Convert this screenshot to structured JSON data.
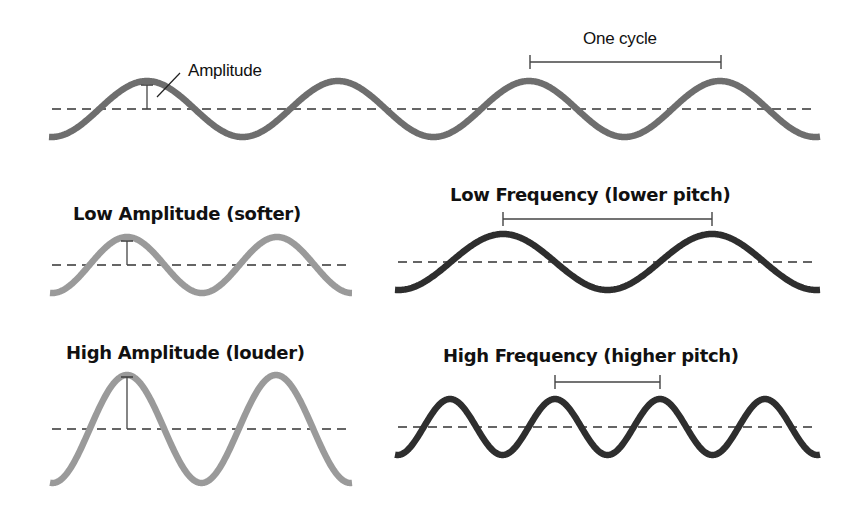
{
  "colors": {
    "wave_medium": "#6e6e6e",
    "wave_light": "#9a9a9a",
    "wave_dark": "#2e2e2e",
    "midline": "#333333",
    "marker": "#444444",
    "text": "#111111"
  },
  "labels": {
    "amplitude": "Amplitude",
    "one_cycle": "One cycle",
    "low_amplitude": "Low Amplitude (softer)",
    "high_amplitude": "High Amplitude (louder)",
    "low_frequency": "Low Frequency (lower pitch)",
    "high_frequency": "High Frequency (higher pitch)"
  },
  "waves": [
    {
      "id": "reference-wave",
      "x0": 49,
      "x1": 820,
      "mid": 109,
      "amp": 28,
      "first_peak": 147,
      "period": 191,
      "color": "wave_medium",
      "stroke": 6.5
    },
    {
      "id": "low-amplitude-wave",
      "x0": 50,
      "x1": 352,
      "mid": 265,
      "amp": 28,
      "first_peak": 127,
      "period": 150,
      "color": "wave_light",
      "stroke": 6.5
    },
    {
      "id": "high-amplitude-wave",
      "x0": 50,
      "x1": 352,
      "mid": 429,
      "amp": 54,
      "first_peak": 127,
      "period": 149,
      "color": "wave_light",
      "stroke": 6.5
    },
    {
      "id": "low-frequency-wave",
      "x0": 395,
      "x1": 820,
      "mid": 262,
      "amp": 28,
      "first_peak": 503,
      "period": 209,
      "color": "wave_dark",
      "stroke": 6.5
    },
    {
      "id": "high-frequency-wave",
      "x0": 395,
      "x1": 820,
      "mid": 427,
      "amp": 28,
      "first_peak": 450,
      "period": 105,
      "color": "wave_dark",
      "stroke": 6.5
    }
  ],
  "midlines": [
    {
      "id": "reference-midline",
      "x0": 52,
      "x1": 815,
      "y": 109
    },
    {
      "id": "low-amplitude-midline",
      "x0": 52,
      "x1": 350,
      "y": 265
    },
    {
      "id": "high-amplitude-midline",
      "x0": 52,
      "x1": 350,
      "y": 429
    },
    {
      "id": "low-frequency-midline",
      "x0": 398,
      "x1": 818,
      "y": 262
    },
    {
      "id": "high-frequency-midline",
      "x0": 398,
      "x1": 818,
      "y": 427
    }
  ],
  "amplitude_markers": [
    {
      "id": "reference-amplitude-marker",
      "x": 147,
      "y_top": 85,
      "y_bottom": 109
    },
    {
      "id": "low-amplitude-marker",
      "x": 127,
      "y_top": 241,
      "y_bottom": 265
    },
    {
      "id": "high-amplitude-marker",
      "x": 127,
      "y_top": 377,
      "y_bottom": 429
    }
  ],
  "cycle_brackets": [
    {
      "id": "one-cycle-bracket",
      "x0": 530,
      "x1": 721,
      "y": 62,
      "tick": 7
    },
    {
      "id": "low-frequency-cycle-bracket",
      "x0": 503,
      "x1": 712,
      "y": 219,
      "tick": 7
    },
    {
      "id": "high-frequency-cycle-bracket",
      "x0": 555,
      "x1": 660,
      "y": 382,
      "tick": 7
    }
  ],
  "leader_line": {
    "x0": 157,
    "y0": 97,
    "x1": 180,
    "y1": 73
  },
  "label_positions": {
    "amplitude": {
      "left": 188,
      "top": 61
    },
    "one_cycle": {
      "left": 583,
      "top": 29
    },
    "low_amplitude": {
      "left": 73,
      "top": 203
    },
    "high_amplitude": {
      "left": 66,
      "top": 342
    },
    "low_frequency": {
      "left": 450,
      "top": 184
    },
    "high_frequency": {
      "left": 443,
      "top": 345
    }
  }
}
